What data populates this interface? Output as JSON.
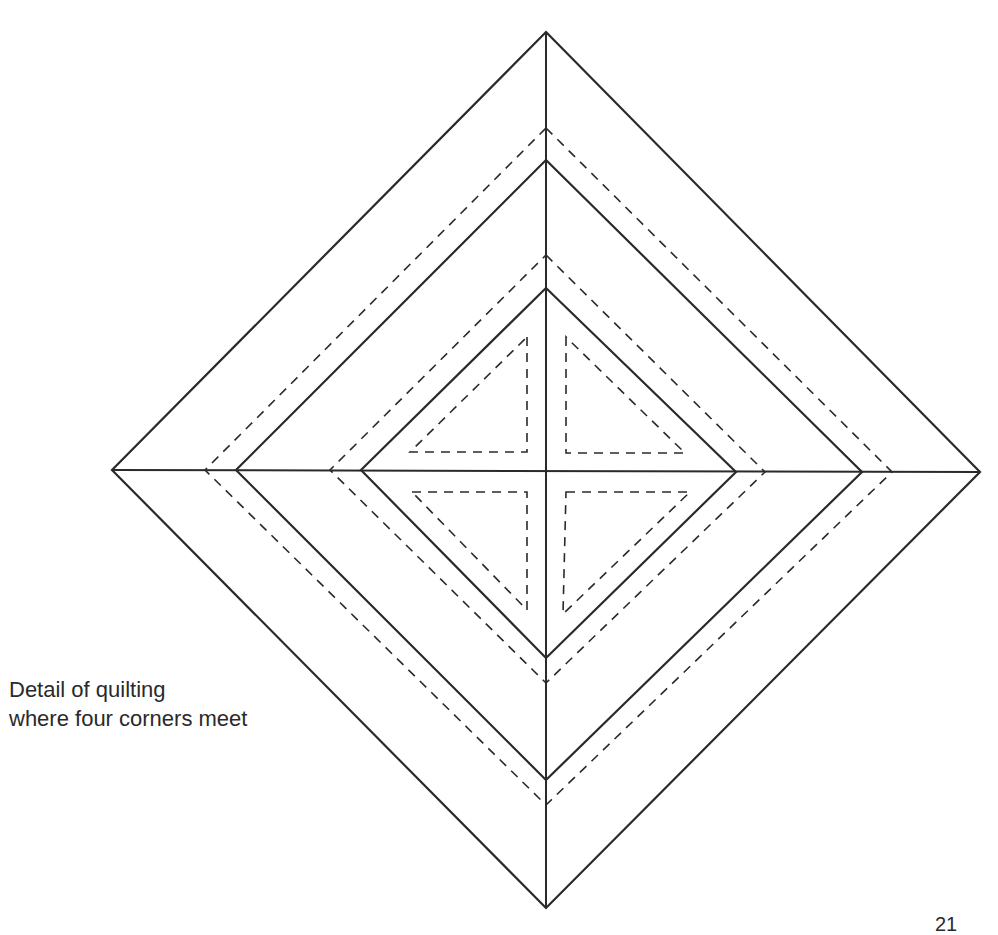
{
  "caption": {
    "line1": "Detail of quilting",
    "line2": "where four corners meet"
  },
  "page_number": "21",
  "colors": {
    "ink": "#2a2a2a",
    "paper": "#ffffff"
  },
  "diagram": {
    "center": [
      546,
      470
    ],
    "nested_diamonds": [
      {
        "style": "solid",
        "top": [
          546,
          32
        ],
        "right": [
          980,
          472
        ],
        "bottom": [
          546,
          908
        ],
        "left": [
          112,
          470
        ]
      },
      {
        "style": "dashed",
        "top": [
          546,
          128
        ],
        "right": [
          892,
          472
        ],
        "bottom": [
          546,
          805
        ],
        "left": [
          205,
          470
        ]
      },
      {
        "style": "solid",
        "top": [
          546,
          160
        ],
        "right": [
          862,
          472
        ],
        "bottom": [
          546,
          780
        ],
        "left": [
          236,
          470
        ]
      },
      {
        "style": "dashed",
        "top": [
          546,
          255
        ],
        "right": [
          765,
          472
        ],
        "bottom": [
          546,
          683
        ],
        "left": [
          330,
          470
        ]
      },
      {
        "style": "solid",
        "top": [
          546,
          288
        ],
        "right": [
          736,
          472
        ],
        "bottom": [
          546,
          658
        ],
        "left": [
          361,
          470
        ]
      }
    ],
    "inner_triangles": [
      {
        "name": "top-left",
        "points": [
          [
            527,
            337
          ],
          [
            527,
            452
          ],
          [
            410,
            452
          ]
        ]
      },
      {
        "name": "top-right",
        "points": [
          [
            566,
            337
          ],
          [
            566,
            453
          ],
          [
            685,
            453
          ]
        ]
      },
      {
        "name": "bottom-left",
        "points": [
          [
            412,
            492
          ],
          [
            527,
            492
          ],
          [
            527,
            610
          ]
        ]
      },
      {
        "name": "bottom-right",
        "points": [
          [
            566,
            492
          ],
          [
            690,
            492
          ],
          [
            563,
            614
          ]
        ]
      }
    ]
  }
}
